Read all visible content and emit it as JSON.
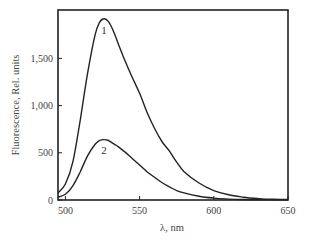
{
  "chart_data": {
    "type": "line",
    "title": "",
    "xlabel": "λ, nm",
    "ylabel": "Fluorescence, Rel. units",
    "xlim": [
      495,
      650
    ],
    "ylim": [
      0,
      2000
    ],
    "xticks": [
      500,
      550,
      600,
      650
    ],
    "xtick_labels": [
      "500",
      "550",
      "600",
      "650"
    ],
    "yticks": [
      0,
      500,
      1000,
      1500
    ],
    "ytick_labels": [
      "0",
      "500",
      "1,000",
      "1,500"
    ],
    "grid": false,
    "legend": "none (inline curve labels)",
    "series": [
      {
        "name": "1",
        "x": [
          495,
          500,
          505,
          510,
          515,
          520,
          523,
          526,
          529,
          532,
          536,
          540,
          545,
          550,
          555,
          560,
          565,
          570,
          575,
          580,
          590,
          600,
          610,
          620,
          630,
          640,
          650
        ],
        "values": [
          75,
          170,
          400,
          850,
          1350,
          1750,
          1880,
          1920,
          1890,
          1800,
          1640,
          1480,
          1300,
          1130,
          930,
          760,
          620,
          520,
          400,
          300,
          180,
          100,
          55,
          30,
          15,
          8,
          5
        ]
      },
      {
        "name": "2",
        "x": [
          495,
          500,
          505,
          510,
          515,
          520,
          523,
          526,
          529,
          532,
          536,
          540,
          545,
          550,
          555,
          560,
          565,
          570,
          575,
          580,
          590,
          600,
          610,
          620,
          630,
          640,
          650
        ],
        "values": [
          30,
          60,
          150,
          300,
          470,
          590,
          630,
          640,
          630,
          600,
          560,
          510,
          440,
          370,
          300,
          240,
          185,
          140,
          100,
          75,
          40,
          20,
          10,
          5,
          3,
          2,
          1
        ]
      }
    ],
    "annotations": [
      {
        "text": "1",
        "x": 526,
        "y": 1800
      },
      {
        "text": "2",
        "x": 526,
        "y": 530
      }
    ]
  }
}
